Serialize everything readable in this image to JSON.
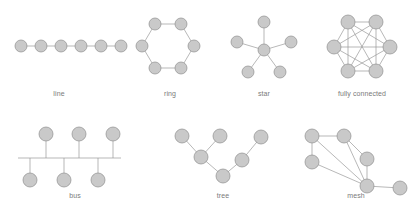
{
  "figure": {
    "background_color": "#ffffff",
    "node_fill": "#c9c9c9",
    "node_stroke": "#8f8f8f",
    "edge_color": "#9a9a9a",
    "label_color": "#7a7a7a"
  },
  "diagrams": [
    {
      "id": "line",
      "label": "line",
      "node_count": 6,
      "edge_count": 5,
      "box": {
        "x": 0,
        "y": 8,
        "w": 118,
        "h": 96
      },
      "caption_y": 82,
      "node_radius": 6,
      "nodes": [
        {
          "id": "n0",
          "x": 21,
          "y": 38
        },
        {
          "id": "n1",
          "x": 41,
          "y": 38
        },
        {
          "id": "n2",
          "x": 61,
          "y": 38
        },
        {
          "id": "n3",
          "x": 81,
          "y": 38
        },
        {
          "id": "n4",
          "x": 101,
          "y": 38
        },
        {
          "id": "n5",
          "x": 121,
          "y": 38
        }
      ],
      "edges": [
        [
          "n0",
          "n1"
        ],
        [
          "n1",
          "n2"
        ],
        [
          "n2",
          "n3"
        ],
        [
          "n3",
          "n4"
        ],
        [
          "n4",
          "n5"
        ]
      ]
    },
    {
      "id": "ring",
      "label": "ring",
      "node_count": 6,
      "edge_count": 6,
      "box": {
        "x": 128,
        "y": 8,
        "w": 84,
        "h": 96
      },
      "caption_y": 82,
      "node_radius": 6,
      "nodes": [
        {
          "id": "n0",
          "x": 27,
          "y": 16
        },
        {
          "id": "n1",
          "x": 53,
          "y": 16
        },
        {
          "id": "n2",
          "x": 66,
          "y": 38
        },
        {
          "id": "n3",
          "x": 53,
          "y": 60
        },
        {
          "id": "n4",
          "x": 27,
          "y": 60
        },
        {
          "id": "n5",
          "x": 14,
          "y": 38
        }
      ],
      "edges": [
        [
          "n0",
          "n1"
        ],
        [
          "n1",
          "n2"
        ],
        [
          "n2",
          "n3"
        ],
        [
          "n3",
          "n4"
        ],
        [
          "n4",
          "n5"
        ],
        [
          "n5",
          "n0"
        ]
      ]
    },
    {
      "id": "star",
      "label": "star",
      "node_count": 6,
      "edge_count": 5,
      "box": {
        "x": 222,
        "y": 8,
        "w": 84,
        "h": 96
      },
      "caption_y": 82,
      "node_radius": 6,
      "nodes": [
        {
          "id": "hub",
          "x": 42,
          "y": 42
        },
        {
          "id": "n1",
          "x": 42,
          "y": 14
        },
        {
          "id": "n2",
          "x": 69,
          "y": 34
        },
        {
          "id": "n3",
          "x": 58,
          "y": 64
        },
        {
          "id": "n4",
          "x": 26,
          "y": 64
        },
        {
          "id": "n5",
          "x": 15,
          "y": 34
        }
      ],
      "edges": [
        [
          "hub",
          "n1"
        ],
        [
          "hub",
          "n2"
        ],
        [
          "hub",
          "n3"
        ],
        [
          "hub",
          "n4"
        ],
        [
          "hub",
          "n5"
        ]
      ]
    },
    {
      "id": "fully-connected",
      "label": "fully connected",
      "node_count": 6,
      "edge_count": 15,
      "box": {
        "x": 310,
        "y": 8,
        "w": 104,
        "h": 96
      },
      "caption_y": 82,
      "node_radius": 7,
      "nodes": [
        {
          "id": "n0",
          "x": 38,
          "y": 14
        },
        {
          "id": "n1",
          "x": 66,
          "y": 14
        },
        {
          "id": "n2",
          "x": 80,
          "y": 39
        },
        {
          "id": "n3",
          "x": 66,
          "y": 63
        },
        {
          "id": "n4",
          "x": 38,
          "y": 63
        },
        {
          "id": "n5",
          "x": 24,
          "y": 39
        }
      ],
      "edges": [
        [
          "n0",
          "n1"
        ],
        [
          "n0",
          "n2"
        ],
        [
          "n0",
          "n3"
        ],
        [
          "n0",
          "n4"
        ],
        [
          "n0",
          "n5"
        ],
        [
          "n1",
          "n2"
        ],
        [
          "n1",
          "n3"
        ],
        [
          "n1",
          "n4"
        ],
        [
          "n1",
          "n5"
        ],
        [
          "n2",
          "n3"
        ],
        [
          "n2",
          "n4"
        ],
        [
          "n2",
          "n5"
        ],
        [
          "n3",
          "n4"
        ],
        [
          "n3",
          "n5"
        ],
        [
          "n4",
          "n5"
        ]
      ]
    },
    {
      "id": "bus",
      "label": "bus",
      "node_count": 6,
      "edge_count": 6,
      "box": {
        "x": 0,
        "y": 118,
        "w": 150,
        "h": 92
      },
      "caption_y": 74,
      "node_radius": 7,
      "backbone": {
        "x1": 18,
        "x2": 121,
        "y": 40
      },
      "nodes": [
        {
          "id": "t1",
          "x": 46,
          "y": 16
        },
        {
          "id": "t2",
          "x": 79,
          "y": 16
        },
        {
          "id": "t3",
          "x": 113,
          "y": 16
        },
        {
          "id": "b1",
          "x": 30,
          "y": 62
        },
        {
          "id": "b2",
          "x": 64,
          "y": 62
        },
        {
          "id": "b3",
          "x": 98,
          "y": 62
        }
      ],
      "stubs": [
        {
          "node": "t1",
          "x": 46,
          "y1": 23,
          "y2": 40
        },
        {
          "node": "t2",
          "x": 79,
          "y1": 23,
          "y2": 40
        },
        {
          "node": "t3",
          "x": 113,
          "y1": 23,
          "y2": 40
        },
        {
          "node": "b1",
          "x": 30,
          "y1": 40,
          "y2": 55
        },
        {
          "node": "b2",
          "x": 64,
          "y1": 40,
          "y2": 55
        },
        {
          "node": "b3",
          "x": 98,
          "y1": 40,
          "y2": 55
        }
      ]
    },
    {
      "id": "tree",
      "label": "tree",
      "node_count": 7,
      "edge_count": 6,
      "box": {
        "x": 168,
        "y": 118,
        "w": 110,
        "h": 92
      },
      "caption_y": 74,
      "node_radius": 7,
      "nodes": [
        {
          "id": "root",
          "x": 55,
          "y": 58
        },
        {
          "id": "a",
          "x": 33,
          "y": 39
        },
        {
          "id": "b",
          "x": 74,
          "y": 42
        },
        {
          "id": "a1",
          "x": 14,
          "y": 18
        },
        {
          "id": "a2",
          "x": 52,
          "y": 18
        },
        {
          "id": "b1",
          "x": 93,
          "y": 19
        }
      ],
      "edges": [
        [
          "root",
          "a"
        ],
        [
          "root",
          "b"
        ],
        [
          "a",
          "a1"
        ],
        [
          "a",
          "a2"
        ],
        [
          "b",
          "b1"
        ]
      ]
    },
    {
      "id": "mesh",
      "label": "mesh",
      "node_count": 6,
      "edge_count": 8,
      "box": {
        "x": 296,
        "y": 118,
        "w": 120,
        "h": 92
      },
      "caption_y": 74,
      "node_radius": 7,
      "nodes": [
        {
          "id": "n0",
          "x": 16,
          "y": 18
        },
        {
          "id": "n1",
          "x": 48,
          "y": 18
        },
        {
          "id": "n2",
          "x": 16,
          "y": 44
        },
        {
          "id": "n3",
          "x": 71,
          "y": 41
        },
        {
          "id": "n4",
          "x": 71,
          "y": 68
        },
        {
          "id": "n5",
          "x": 104,
          "y": 70
        }
      ],
      "edges": [
        [
          "n0",
          "n1"
        ],
        [
          "n0",
          "n2"
        ],
        [
          "n0",
          "n4"
        ],
        [
          "n1",
          "n3"
        ],
        [
          "n1",
          "n4"
        ],
        [
          "n2",
          "n4"
        ],
        [
          "n3",
          "n4"
        ],
        [
          "n4",
          "n5"
        ]
      ]
    }
  ]
}
